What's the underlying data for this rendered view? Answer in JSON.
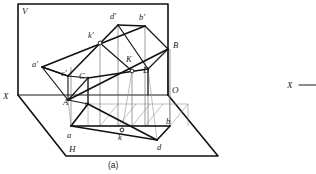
{
  "figure": {
    "caption": "(a)",
    "plane_labels": {
      "vertical_plane": "V",
      "horizontal_plane": "H",
      "ground_line_left": "X",
      "origin": "O"
    },
    "space_points": [
      {
        "name": "A",
        "label": "A",
        "x": 68,
        "y": 100,
        "tx": 63,
        "ty": 105
      },
      {
        "name": "B",
        "label": "B",
        "x": 168,
        "y": 49,
        "tx": 173,
        "ty": 48
      },
      {
        "name": "C",
        "label": "C",
        "x": 88,
        "y": 78,
        "tx": 80,
        "ty": 78
      },
      {
        "name": "D",
        "label": "D",
        "x": 148,
        "y": 69,
        "tx": 142,
        "ty": 73
      },
      {
        "name": "K",
        "label": "K",
        "x": 132,
        "y": 71,
        "tx": 126,
        "ty": 62
      }
    ],
    "front_view_points": [
      {
        "name": "a-prime",
        "label": "a'",
        "x": 42,
        "y": 67,
        "tx": 33,
        "ty": 66
      },
      {
        "name": "b-prime",
        "label": "b'",
        "x": 145,
        "y": 26,
        "tx": 140,
        "ty": 19
      },
      {
        "name": "c-prime",
        "label": "c'",
        "x": 68,
        "y": 76,
        "tx": 62,
        "ty": 75
      },
      {
        "name": "d-prime",
        "label": "d'",
        "x": 118,
        "y": 25,
        "tx": 111,
        "ty": 18
      },
      {
        "name": "k-prime",
        "label": "k'",
        "x": 100,
        "y": 43,
        "tx": 90,
        "ty": 37
      }
    ],
    "top_view_points": [
      {
        "name": "a",
        "label": "a",
        "x": 71,
        "y": 126,
        "tx": 68,
        "ty": 137
      },
      {
        "name": "b",
        "label": "b",
        "x": 170,
        "y": 126,
        "tx": 167,
        "ty": 125
      },
      {
        "name": "c",
        "label": "c",
        "x": 88,
        "y": 104,
        "tx": 86,
        "ty": 105
      },
      {
        "name": "d",
        "label": "d",
        "x": 157,
        "y": 140,
        "tx": 158,
        "ty": 148
      },
      {
        "name": "k",
        "label": "k",
        "x": 122,
        "y": 130,
        "tx": 119,
        "ty": 139
      }
    ],
    "adjacent_fragment": {
      "ground_line_label": "X",
      "has_rule": true
    }
  }
}
